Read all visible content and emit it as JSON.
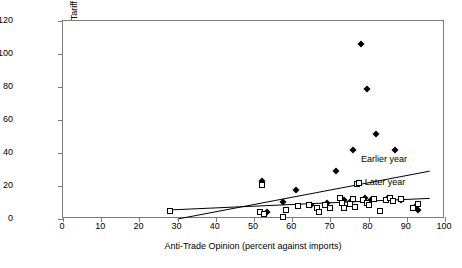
{
  "chart_data": {
    "type": "scatter",
    "title": "",
    "xlabel": "Anti-Trade Opinion (percent against imports)",
    "ylabel": "Unweighted Average Tariff Rate",
    "xlim": [
      0,
      100
    ],
    "ylim": [
      0,
      120
    ],
    "xticks": [
      0,
      10,
      20,
      30,
      40,
      50,
      60,
      70,
      80,
      90,
      100
    ],
    "yticks": [
      0,
      20,
      40,
      60,
      80,
      100,
      120
    ],
    "grid": false,
    "legend_position": "inline-annotation",
    "series": [
      {
        "name": "Earlier year",
        "marker": "filled-diamond",
        "color": "#000000",
        "points": [
          [
            52.0,
            23.0
          ],
          [
            53.5,
            4.0
          ],
          [
            57.5,
            10.5
          ],
          [
            61.0,
            17.5
          ],
          [
            65.0,
            8.5
          ],
          [
            69.0,
            10.0
          ],
          [
            71.5,
            29.0
          ],
          [
            73.5,
            11.5
          ],
          [
            75.0,
            10.5
          ],
          [
            76.0,
            42.0
          ],
          [
            78.0,
            106.0
          ],
          [
            79.0,
            12.5
          ],
          [
            79.5,
            79.0
          ],
          [
            80.5,
            11.5
          ],
          [
            82.0,
            51.5
          ],
          [
            85.0,
            13.0
          ],
          [
            87.0,
            42.0
          ],
          [
            88.5,
            11.5
          ],
          [
            92.5,
            8.0
          ],
          [
            93.0,
            5.5
          ]
        ]
      },
      {
        "name": "Later year",
        "marker": "open-square",
        "color": "#000000",
        "points": [
          [
            28.0,
            5.0
          ],
          [
            51.5,
            4.0
          ],
          [
            52.0,
            20.5
          ],
          [
            52.5,
            3.0
          ],
          [
            57.5,
            1.0
          ],
          [
            58.5,
            5.5
          ],
          [
            61.5,
            8.0
          ],
          [
            64.5,
            8.5
          ],
          [
            66.5,
            6.5
          ],
          [
            67.0,
            4.0
          ],
          [
            68.5,
            8.5
          ],
          [
            70.0,
            6.5
          ],
          [
            72.5,
            12.5
          ],
          [
            73.0,
            10.0
          ],
          [
            73.5,
            6.5
          ],
          [
            75.0,
            9.0
          ],
          [
            76.0,
            12.0
          ],
          [
            76.5,
            7.0
          ],
          [
            77.0,
            21.0
          ],
          [
            78.5,
            11.5
          ],
          [
            79.5,
            9.5
          ],
          [
            80.0,
            8.5
          ],
          [
            81.5,
            12.0
          ],
          [
            83.0,
            5.0
          ],
          [
            84.5,
            11.5
          ],
          [
            85.5,
            12.5
          ],
          [
            86.5,
            11.0
          ],
          [
            88.5,
            12.0
          ],
          [
            91.5,
            6.5
          ],
          [
            93.0,
            9.0
          ]
        ]
      }
    ],
    "trendlines": [
      {
        "name": "Earlier year",
        "label": "Earlier year",
        "x0": 30.0,
        "y0": 0.0,
        "x1": 96.0,
        "y1": 29.0
      },
      {
        "name": "Later year",
        "label": "Later year",
        "x0": 28.0,
        "y0": 5.5,
        "x1": 96.0,
        "y1": 12.5
      }
    ],
    "annotations": [
      {
        "text": "Earlier year",
        "x": 78.0,
        "y": 36.0,
        "marker": "none"
      },
      {
        "text": "Later year",
        "x": 79.0,
        "y": 22.0,
        "marker": "open-square"
      }
    ]
  }
}
